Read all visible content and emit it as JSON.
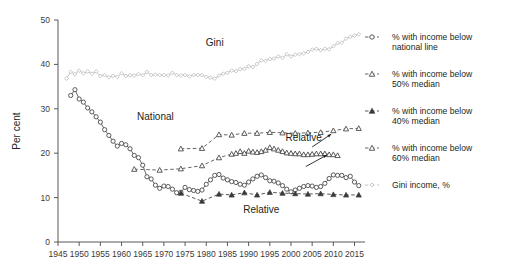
{
  "chart_data": {
    "type": "line",
    "title": "",
    "xlabel": "",
    "ylabel": "Per cent",
    "xlim": [
      1945,
      2017
    ],
    "ylim": [
      0,
      50
    ],
    "xticks": [
      1945,
      1950,
      1955,
      1960,
      1965,
      1970,
      1975,
      1980,
      1985,
      1990,
      1995,
      2000,
      2005,
      2010,
      2015
    ],
    "yticks": [
      0,
      10,
      20,
      30,
      40,
      50
    ],
    "grid": false,
    "legend_position": "right",
    "annotations": [
      {
        "text": "Gini",
        "x": 1982,
        "y": 44.2
      },
      {
        "text": "National",
        "x": 1968,
        "y": 27.5
      },
      {
        "text": "Relative",
        "x": 2003,
        "y": 22.8
      },
      {
        "text": "Relative",
        "x": 1993,
        "y": 6.6
      }
    ],
    "series": [
      {
        "name": "Gini income, %",
        "marker": "diamond-open",
        "color": "#b9bbbd",
        "x": [
          1947,
          1948,
          1949,
          1950,
          1951,
          1952,
          1953,
          1954,
          1955,
          1956,
          1957,
          1958,
          1959,
          1960,
          1961,
          1962,
          1963,
          1964,
          1965,
          1966,
          1967,
          1968,
          1969,
          1970,
          1971,
          1972,
          1973,
          1974,
          1975,
          1976,
          1977,
          1978,
          1979,
          1980,
          1981,
          1982,
          1983,
          1984,
          1985,
          1986,
          1987,
          1988,
          1989,
          1990,
          1991,
          1992,
          1993,
          1994,
          1995,
          1996,
          1997,
          1998,
          1999,
          2000,
          2001,
          2002,
          2003,
          2004,
          2005,
          2006,
          2007,
          2008,
          2009,
          2010,
          2011,
          2012,
          2013,
          2014,
          2015,
          2016
        ],
        "values": [
          36.8,
          38.3,
          37.8,
          38.6,
          38.0,
          38.4,
          37.9,
          38.4,
          37.4,
          37.6,
          37.1,
          37.4,
          37.2,
          38.0,
          37.4,
          37.6,
          37.5,
          37.8,
          37.6,
          38.3,
          37.6,
          37.7,
          37.6,
          37.6,
          37.5,
          38.1,
          37.6,
          37.5,
          37.6,
          37.3,
          37.6,
          37.6,
          37.6,
          37.2,
          37.0,
          36.8,
          37.5,
          37.9,
          38.1,
          38.6,
          38.5,
          38.9,
          39.0,
          39.6,
          39.4,
          40.1,
          40.9,
          40.8,
          41.2,
          41.3,
          41.8,
          41.5,
          42.3,
          41.8,
          42.2,
          42.3,
          42.5,
          42.8,
          43.3,
          43.5,
          43.2,
          43.5,
          43.4,
          44.1,
          44.8,
          44.9,
          45.8,
          46.2,
          46.5,
          46.8
        ]
      },
      {
        "name": "% with income below national line",
        "marker": "circle-open",
        "color": "#4a4a4a",
        "x": [
          1948,
          1949,
          1950,
          1951,
          1952,
          1953,
          1954,
          1955,
          1956,
          1957,
          1958,
          1959,
          1960,
          1961,
          1962,
          1963,
          1964,
          1965,
          1966,
          1967,
          1968,
          1969,
          1970,
          1971,
          1972,
          1973,
          1974,
          1975,
          1976,
          1977,
          1978,
          1979,
          1980,
          1981,
          1982,
          1983,
          1984,
          1985,
          1986,
          1987,
          1988,
          1989,
          1990,
          1991,
          1992,
          1993,
          1994,
          1995,
          1996,
          1997,
          1998,
          1999,
          2000,
          2001,
          2002,
          2003,
          2004,
          2005,
          2006,
          2007,
          2008,
          2009,
          2010,
          2011,
          2012,
          2013,
          2014,
          2015,
          2016
        ],
        "values": [
          33.0,
          34.3,
          32.2,
          31.5,
          30.2,
          29.3,
          28.2,
          27.0,
          25.3,
          24.0,
          22.7,
          21.6,
          22.2,
          21.9,
          21.0,
          19.5,
          19.0,
          17.3,
          14.7,
          14.2,
          12.8,
          12.1,
          12.6,
          12.5,
          11.9,
          11.1,
          11.2,
          12.3,
          11.8,
          11.6,
          11.4,
          11.7,
          13.0,
          14.0,
          15.0,
          15.2,
          14.4,
          14.0,
          13.6,
          13.4,
          13.0,
          12.8,
          13.5,
          14.2,
          14.8,
          15.1,
          14.5,
          13.8,
          13.7,
          13.3,
          12.7,
          11.9,
          11.3,
          11.7,
          12.1,
          12.5,
          12.7,
          12.6,
          12.3,
          12.5,
          13.2,
          14.3,
          15.1,
          15.0,
          15.0,
          14.5,
          14.8,
          13.5,
          12.7
        ]
      },
      {
        "name": "% with income below 60% median",
        "marker": "triangle-open",
        "color": "#4a4a4a",
        "x": [
          1974,
          1979,
          1983,
          1986,
          1989,
          1992,
          1995,
          1998,
          2001,
          2004,
          2007,
          2010,
          2013,
          2016
        ],
        "values": [
          21.0,
          21.1,
          24.2,
          24.1,
          24.5,
          24.5,
          24.7,
          24.6,
          24.5,
          24.6,
          24.7,
          25.1,
          25.5,
          25.6
        ]
      },
      {
        "name": "% with income below 50% median",
        "marker": "triangle-open",
        "color": "#4a4a4a",
        "x": [
          1963,
          1969,
          1974,
          1979,
          1983,
          1986,
          1987,
          1988,
          1989,
          1990,
          1991,
          1992,
          1993,
          1994,
          1995,
          1996,
          1997,
          1998,
          1999,
          2000,
          2001,
          2002,
          2003,
          2004,
          2005,
          2006,
          2007,
          2008,
          2009,
          2010,
          2011
        ],
        "values": [
          16.4,
          16.2,
          16.5,
          17.2,
          19.0,
          19.8,
          20.0,
          20.4,
          20.0,
          20.5,
          20.3,
          20.2,
          20.4,
          20.7,
          21.3,
          21.0,
          20.7,
          20.4,
          20.1,
          20.0,
          19.9,
          19.9,
          19.7,
          19.7,
          19.8,
          19.9,
          19.9,
          19.9,
          19.7,
          19.7,
          19.5
        ]
      },
      {
        "name": "% with income below 40% median",
        "marker": "triangle-filled",
        "color": "#3a3a3a",
        "x": [
          1974,
          1979,
          1983,
          1986,
          1989,
          1992,
          1995,
          1998,
          2001,
          2004,
          2007,
          2010,
          2013,
          2016
        ],
        "values": [
          11.0,
          9.2,
          10.8,
          10.6,
          11.1,
          10.6,
          11.2,
          11.0,
          10.9,
          10.8,
          10.9,
          10.7,
          10.6,
          10.6
        ]
      }
    ]
  },
  "legend": {
    "items": [
      {
        "label_line1": "% with income below",
        "label_line2": "national line",
        "marker": "circle-open"
      },
      {
        "label_line1": "% with income below",
        "label_line2": "50% median",
        "marker": "triangle-open"
      },
      {
        "label_line1": "% with income below",
        "label_line2": "40% median",
        "marker": "triangle-filled"
      },
      {
        "label_line1": "% with income below",
        "label_line2": "60% median",
        "marker": "triangle-open"
      },
      {
        "label_line1": "Gini income, %",
        "label_line2": "",
        "marker": "diamond-open"
      }
    ]
  },
  "colors": {
    "gini": "#b9bbbd",
    "dark": "#4a4a4a",
    "axis": "#58595b",
    "text": "#231f20",
    "background": "#ffffff"
  }
}
